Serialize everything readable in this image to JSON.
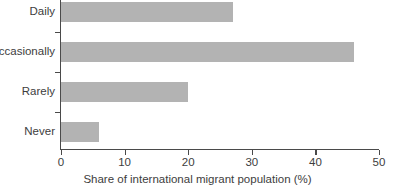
{
  "chart_data": {
    "type": "bar",
    "orientation": "horizontal",
    "title": "",
    "xlabel": "Share of international migrant population (%)",
    "ylabel": "",
    "categories": [
      "Daily",
      "Occasionally",
      "Rarely",
      "Never"
    ],
    "values": [
      27,
      46,
      20,
      6
    ],
    "xlim": [
      0,
      50
    ],
    "xticks": [
      0,
      10,
      20,
      30,
      40,
      50
    ],
    "xtick_labels": [
      "0",
      "10",
      "20",
      "30",
      "40",
      "50"
    ],
    "grid": false,
    "legend": null,
    "bar_color": "#b3b3b3",
    "axis_color": "#4a4a4a",
    "text_color": "#3d3d3d"
  }
}
